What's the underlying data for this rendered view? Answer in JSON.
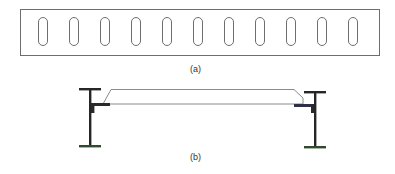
{
  "figure": {
    "panel_a": {
      "label": "(a)",
      "description": "Plan view of plate with slotted holes",
      "slot_count": 11
    },
    "panel_b": {
      "label": "(b)",
      "description": "Section view of deck plate spanning between two I-beams on angle supports"
    },
    "colors": {
      "outline": "#707070",
      "beam": "#262626",
      "angle": "#2a2a3a"
    }
  }
}
